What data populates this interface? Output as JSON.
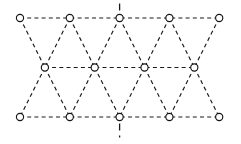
{
  "figure": {
    "kind": "triangular-lattice-diagram",
    "width": 241,
    "height": 144,
    "background_color": "#ffffff",
    "line_color": "#1a1a1a",
    "node_fill_color": "#ffffff",
    "node_stroke_color": "#141414",
    "node_radius": 3.6,
    "edge_style": "dashed",
    "edge_dash_pattern": "4,3.2",
    "edge_stroke_width": 1.15
  },
  "lattice": {
    "row_count": 3,
    "column_spacing": 49.8,
    "row_spacing": 49.5,
    "rows": [
      {
        "name": "top-row",
        "y": 18,
        "node_count": 5,
        "offset": 0,
        "x_positions": [
          20,
          69.8,
          119.6,
          169.4,
          219.2
        ]
      },
      {
        "name": "middle-row",
        "y": 67.5,
        "node_count": 4,
        "offset": 24.9,
        "x_positions": [
          44.9,
          94.7,
          144.5,
          194.3
        ]
      },
      {
        "name": "bottom-row",
        "y": 117,
        "node_count": 5,
        "offset": 0,
        "x_positions": [
          20,
          69.8,
          119.6,
          169.4,
          219.2
        ]
      }
    ],
    "node_total": 14
  },
  "symmetry_axis": {
    "name": "vertical-mirror-axis",
    "x": 119.6,
    "ticks": [
      {
        "name": "top-tick",
        "x": 119.6,
        "y_start": 3.5,
        "y_end": 11.5
      },
      {
        "name": "bottom-tick",
        "x": 119.6,
        "y_start": 123.5,
        "y_end": 137.5
      }
    ]
  },
  "edges": {
    "horizontal": [
      {
        "row": "top-row",
        "y": 18,
        "x_start": 20,
        "x_end": 219.2
      },
      {
        "row": "middle-row",
        "y": 67.5,
        "x_start": 44.9,
        "x_end": 194.3
      },
      {
        "row": "bottom-row",
        "y": 117,
        "x_start": 20,
        "x_end": 219.2
      }
    ],
    "diagonal_upper": [
      {
        "from": [
          20,
          18
        ],
        "to": [
          44.9,
          67.5
        ]
      },
      {
        "from": [
          69.8,
          18
        ],
        "to": [
          44.9,
          67.5
        ]
      },
      {
        "from": [
          69.8,
          18
        ],
        "to": [
          94.7,
          67.5
        ]
      },
      {
        "from": [
          119.6,
          18
        ],
        "to": [
          94.7,
          67.5
        ]
      },
      {
        "from": [
          119.6,
          18
        ],
        "to": [
          144.5,
          67.5
        ]
      },
      {
        "from": [
          169.4,
          18
        ],
        "to": [
          144.5,
          67.5
        ]
      },
      {
        "from": [
          169.4,
          18
        ],
        "to": [
          194.3,
          67.5
        ]
      },
      {
        "from": [
          219.2,
          18
        ],
        "to": [
          194.3,
          67.5
        ]
      }
    ],
    "diagonal_lower": [
      {
        "from": [
          44.9,
          67.5
        ],
        "to": [
          20,
          117
        ]
      },
      {
        "from": [
          44.9,
          67.5
        ],
        "to": [
          69.8,
          117
        ]
      },
      {
        "from": [
          94.7,
          67.5
        ],
        "to": [
          69.8,
          117
        ]
      },
      {
        "from": [
          94.7,
          67.5
        ],
        "to": [
          119.6,
          117
        ]
      },
      {
        "from": [
          144.5,
          67.5
        ],
        "to": [
          119.6,
          117
        ]
      },
      {
        "from": [
          144.5,
          67.5
        ],
        "to": [
          169.4,
          117
        ]
      },
      {
        "from": [
          194.3,
          67.5
        ],
        "to": [
          169.4,
          117
        ]
      },
      {
        "from": [
          194.3,
          67.5
        ],
        "to": [
          219.2,
          117
        ]
      }
    ]
  }
}
